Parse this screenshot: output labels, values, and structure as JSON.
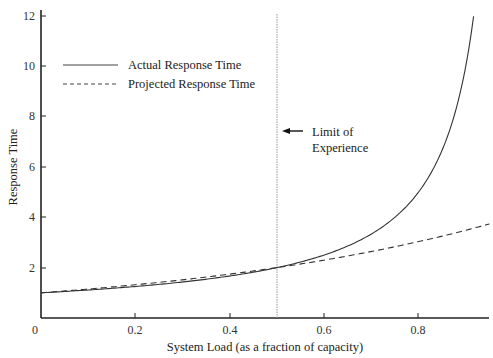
{
  "chart_data": {
    "type": "line",
    "title": "",
    "xlabel": "System Load (as a fraction of capacity)",
    "ylabel": "Response Time",
    "xlim": [
      0,
      0.95
    ],
    "ylim": [
      0,
      12
    ],
    "grid": false,
    "legend_position": "upper-left",
    "x_ticks": [
      "0",
      "0.2",
      "0.4",
      "0.6",
      "0.8"
    ],
    "y_ticks": [
      "2",
      "4",
      "6",
      "8",
      "10",
      "12"
    ],
    "x_tick_values": [
      0,
      0.2,
      0.4,
      0.6,
      0.8
    ],
    "y_tick_values": [
      2,
      4,
      6,
      8,
      10,
      12
    ],
    "x": [
      0,
      0.1,
      0.2,
      0.3,
      0.4,
      0.5,
      0.6,
      0.7,
      0.8,
      0.85,
      0.9,
      0.917,
      0.95
    ],
    "series": [
      {
        "name": "Actual Response Time",
        "style": "solid",
        "values": [
          1.0,
          1.11,
          1.25,
          1.43,
          1.67,
          2.0,
          2.5,
          3.33,
          5.0,
          6.67,
          10.0,
          12.0,
          null
        ]
      },
      {
        "name": "Projected Response Time",
        "style": "dashed",
        "values": [
          1.0,
          1.15,
          1.32,
          1.52,
          1.74,
          2.0,
          2.3,
          2.64,
          3.03,
          3.25,
          3.48,
          3.56,
          3.73
        ]
      }
    ],
    "annotations": [
      {
        "type": "vertical-line",
        "x": 0.5,
        "style": "dotted",
        "label": "Limit of Experience"
      }
    ]
  },
  "labels": {
    "y_tick_12": "12",
    "y_tick_10": "10",
    "y_tick_8": "8",
    "y_tick_6": "6",
    "y_tick_4": "4",
    "y_tick_2": "2",
    "x_tick_0": "0",
    "x_tick_02": "0.2",
    "x_tick_04": "0.4",
    "x_tick_06": "0.6",
    "x_tick_08": "0.8",
    "xlabel": "System Load (as a fraction of capacity)",
    "ylabel": "Response Time",
    "legend_actual": "Actual Response Time",
    "legend_projected": "Projected Response Time",
    "annot_line1": "Limit of",
    "annot_line2": "Experience"
  }
}
